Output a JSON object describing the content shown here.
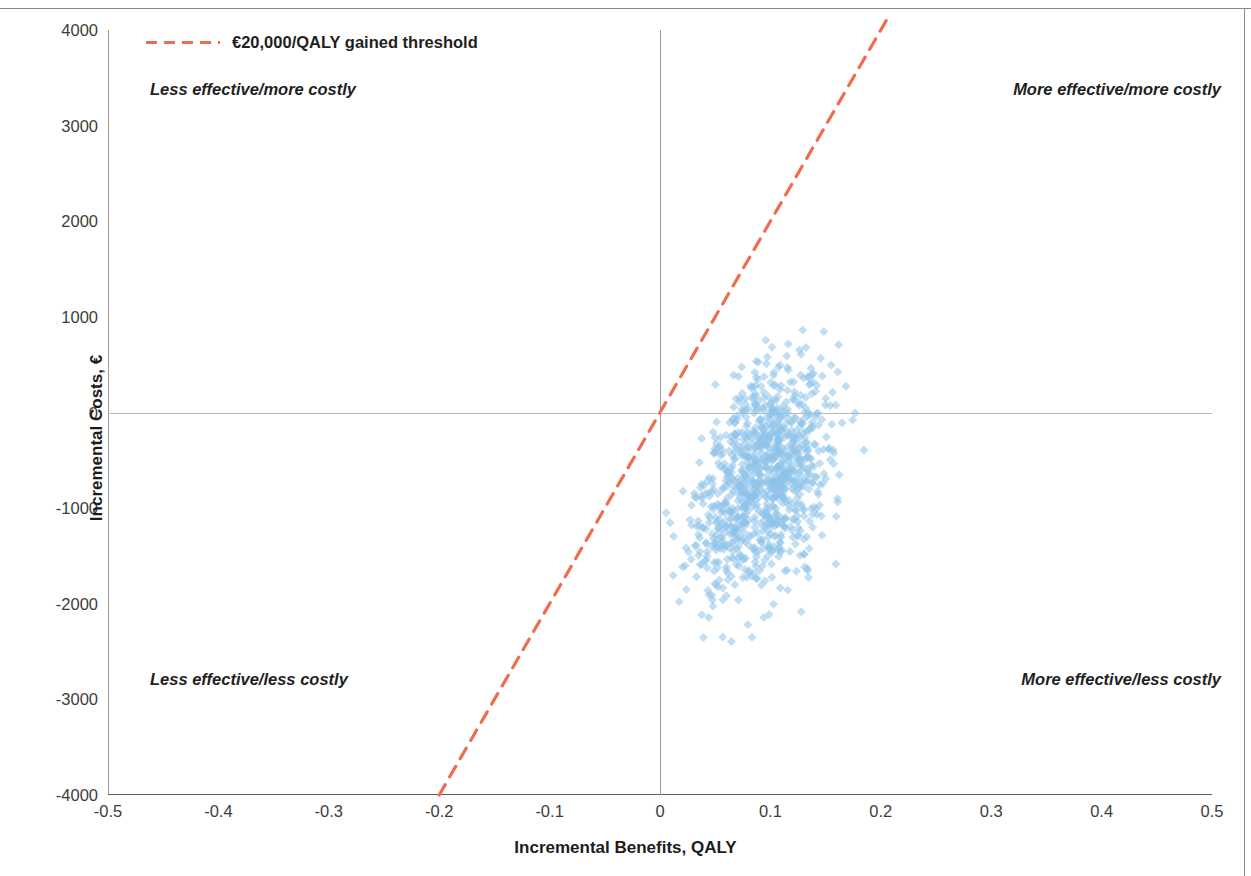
{
  "figure": {
    "type": "cost-effectiveness-plane"
  },
  "axes": {
    "x_title": "Incremental Benefits, QALY",
    "y_title": "Incremental Costs, €",
    "x_ticks": [
      "-0.5",
      "-0.4",
      "-0.3",
      "-0.2",
      "-0.1",
      "0",
      "0.1",
      "0.2",
      "0.3",
      "0.4",
      "0.5"
    ],
    "y_ticks": [
      "4000",
      "3000",
      "2000",
      "1000",
      "0",
      "-1000",
      "-2000",
      "-3000",
      "-4000"
    ]
  },
  "legend": {
    "threshold_label": "€20,000/QALY gained threshold",
    "threshold_color": "#ef6d4f"
  },
  "quadrants": {
    "top_left": "Less effective/more costly",
    "top_right": "More effective/more costly",
    "bottom_left": "Less effective/less costly",
    "bottom_right": "More effective/less costly"
  },
  "chart_data": {
    "type": "scatter",
    "title": "",
    "xlabel": "Incremental Benefits, QALY",
    "ylabel": "Incremental Costs, €",
    "xlim": [
      -0.5,
      0.5
    ],
    "ylim": [
      -4000,
      4000
    ],
    "xticks": [
      -0.5,
      -0.4,
      -0.3,
      -0.2,
      -0.1,
      0,
      0.1,
      0.2,
      0.3,
      0.4,
      0.5
    ],
    "yticks": [
      -4000,
      -3000,
      -2000,
      -1000,
      0,
      1000,
      2000,
      3000,
      4000
    ],
    "grid": false,
    "legend_position": "top-left",
    "marker": {
      "shape": "diamond",
      "color": "#8ec3ea",
      "opacity": 0.55,
      "size_px": 9
    },
    "series": [
      {
        "name": "Bootstrap ICER replicates",
        "n_points": 1000,
        "marker_color": "#8ec3ea",
        "cluster": {
          "x_mean": 0.092,
          "x_sd": 0.031,
          "y_mean": -620,
          "y_sd": 560,
          "correlation": 0.18,
          "x_range": [
            -0.012,
            0.185
          ],
          "y_range": [
            -2520,
            880
          ]
        }
      }
    ],
    "reference_lines": [
      {
        "name": "threshold",
        "label": "€20,000/QALY gained threshold",
        "slope": 20000,
        "intercept": 0,
        "style": "dashed",
        "color": "#ef6d4f",
        "x_from": -0.2,
        "x_to": 0.205
      },
      {
        "name": "zero-cost-axis",
        "slope": 0,
        "intercept": 0,
        "style": "solid",
        "color": "#b9b9b9"
      },
      {
        "name": "zero-effect-axis",
        "orientation": "vertical",
        "x": 0,
        "style": "solid",
        "color": "#9b9b9b"
      }
    ]
  }
}
